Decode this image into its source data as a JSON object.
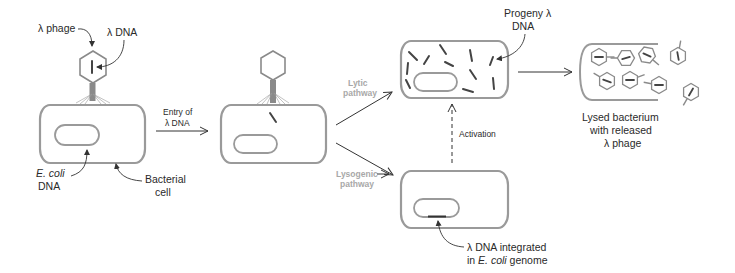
{
  "diagram": {
    "labels": {
      "lambda_phage": "λ phage",
      "lambda_dna": "λ DNA",
      "ecoli_dna_line1": "E. coli",
      "ecoli_dna_line2": "DNA",
      "bacterial_cell_line1": "Bacterial",
      "bacterial_cell_line2": "cell",
      "entry_line1": "Entry of",
      "entry_line2": "λ DNA",
      "lytic_line1": "Lytic",
      "lytic_line2": "pathway",
      "lysogenic_line1": "Lysogenic",
      "lysogenic_line2": "pathway",
      "progeny_line1": "Progeny λ",
      "progeny_line2": "DNA",
      "activation": "Activation",
      "lysed_line1": "Lysed bacterium",
      "lysed_line2": "with released",
      "lysed_line3": "λ phage",
      "integrated_line1": "λ DNA integrated",
      "integrated_line2_a": "in ",
      "integrated_line2_b": "E. coli",
      "integrated_line2_c": " genome"
    },
    "colors": {
      "cell_outline": "#9a9a9a",
      "pathway_label": "#a8a8a8",
      "dna": "#444444",
      "text": "#2a2a2a"
    }
  }
}
